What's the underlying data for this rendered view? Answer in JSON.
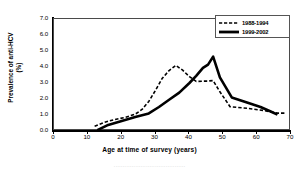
{
  "chart_data": {
    "type": "line",
    "title": "",
    "xlabel": "Age at time of survey (years)",
    "ylabel": "Prevalence of anti-HCV (%)",
    "ylabel_line1": "Prevalence of anti-HCV",
    "ylabel_line2": "(%)",
    "xlim": [
      0,
      70
    ],
    "ylim": [
      0.0,
      7.0
    ],
    "xticks": [
      0,
      10,
      20,
      30,
      40,
      50,
      60,
      70
    ],
    "yticks": [
      "0.0",
      "1.0",
      "2.0",
      "3.0",
      "4.0",
      "5.0",
      "6.0",
      "7.0"
    ],
    "ytick_values": [
      0.0,
      1.0,
      2.0,
      3.0,
      4.0,
      5.0,
      6.0,
      7.0
    ],
    "grid": false,
    "legend_position": "top-right",
    "series": [
      {
        "name": "1988-1994",
        "style": "dashed",
        "color": "#000000",
        "width": 1.6,
        "points": [
          [
            12.0,
            0.3
          ],
          [
            15.0,
            0.55
          ],
          [
            18.0,
            0.72
          ],
          [
            21.0,
            0.85
          ],
          [
            24.0,
            1.05
          ],
          [
            26.0,
            1.35
          ],
          [
            28.0,
            1.85
          ],
          [
            30.0,
            2.55
          ],
          [
            32.0,
            3.3
          ],
          [
            34.0,
            3.78
          ],
          [
            36.0,
            4.1
          ],
          [
            38.0,
            3.8
          ],
          [
            40.0,
            3.4
          ],
          [
            42.0,
            3.1
          ],
          [
            45.0,
            3.12
          ],
          [
            47.0,
            3.15
          ],
          [
            49.0,
            2.45
          ],
          [
            52.0,
            1.52
          ],
          [
            57.0,
            1.42
          ],
          [
            62.0,
            1.28
          ],
          [
            66.0,
            1.12
          ],
          [
            68.5,
            1.12
          ]
        ]
      },
      {
        "name": "1999-2002",
        "style": "solid",
        "color": "#000000",
        "width": 2.6,
        "points": [
          [
            12.8,
            0.05
          ],
          [
            16.0,
            0.38
          ],
          [
            20.0,
            0.62
          ],
          [
            24.0,
            0.88
          ],
          [
            28.0,
            1.1
          ],
          [
            31.0,
            1.5
          ],
          [
            34.0,
            1.95
          ],
          [
            37.0,
            2.4
          ],
          [
            40.0,
            3.0
          ],
          [
            42.0,
            3.45
          ],
          [
            44.0,
            3.95
          ],
          [
            45.5,
            4.15
          ],
          [
            47.0,
            4.65
          ],
          [
            49.0,
            3.35
          ],
          [
            52.5,
            2.1
          ],
          [
            57.0,
            1.78
          ],
          [
            61.0,
            1.5
          ],
          [
            64.0,
            1.22
          ],
          [
            66.0,
            1.02
          ]
        ]
      }
    ],
    "legend_entries": [
      {
        "label": "1988-1994",
        "style": "dashed"
      },
      {
        "label": "1999-2002",
        "style": "solid"
      }
    ]
  },
  "caption": {
    "remnant_text": "········································"
  }
}
